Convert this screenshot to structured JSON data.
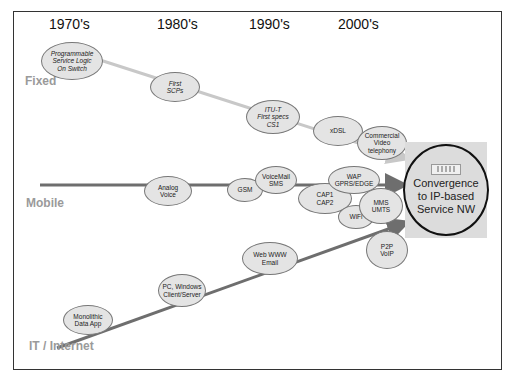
{
  "diagram": {
    "decades": [
      "1970's",
      "1980's",
      "1990's",
      "2000's"
    ],
    "tracks": {
      "fixed": "Fixed",
      "mobile": "Mobile",
      "it": "IT / Internet"
    },
    "nodes": {
      "psl": "Programmable\nService Logic\nOn Switch",
      "scp": "First\nSCPs",
      "itu": "ITU-T\nFirst specs\nCS1",
      "xdsl": "xDSL",
      "video": "Commercial\nVideo\ntelephony",
      "analog": "Analog\nVoice",
      "gsm": "GSM",
      "voicemail": "VoiceMail\nSMS",
      "camel": "CAP1\nCAP2",
      "wap": "WAP\nGPRS/EDGE",
      "wifi": "WiFi",
      "mms": "MMS\nUMTS",
      "mono": "Monolithic\nData App",
      "pc": "PC, Windows\nClient/Server",
      "web": "Web WWW\nEmail",
      "p2p": "P2P\nVoIP"
    },
    "convergence": "Convergence\nto IP-based\nService NW",
    "colors": {
      "fixed_line": "#c8c8c8",
      "mobile_line": "#6e6e6e",
      "it_line": "#6e6e6e",
      "node_fill": "#e4e4e4",
      "track_label": "#9a9a9a"
    }
  }
}
